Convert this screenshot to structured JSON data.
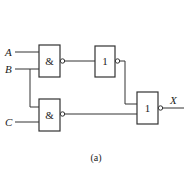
{
  "diagram": {
    "type": "logic-circuit",
    "inputs": [
      {
        "label": "A"
      },
      {
        "label": "B"
      },
      {
        "label": "C"
      }
    ],
    "output": {
      "label": "X"
    },
    "gates": [
      {
        "id": "g1",
        "symbol": "&",
        "type": "NAND",
        "inputs": [
          "A",
          "B"
        ]
      },
      {
        "id": "g2",
        "symbol": "1",
        "type": "NOT",
        "inputs": [
          "g1"
        ]
      },
      {
        "id": "g3",
        "symbol": "&",
        "type": "NAND",
        "inputs": [
          "B",
          "C"
        ]
      },
      {
        "id": "g4",
        "symbol": "1",
        "type": "NOR",
        "inputs": [
          "g2",
          "g3"
        ]
      }
    ],
    "caption": "(a)",
    "colors": {
      "line": "#333333",
      "background": "#ffffff"
    }
  }
}
